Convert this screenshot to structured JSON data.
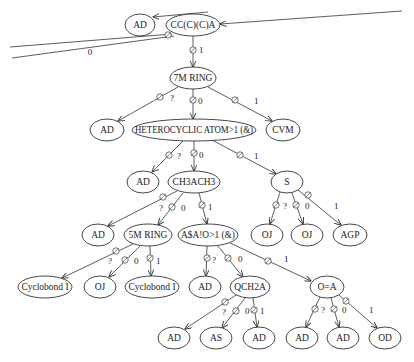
{
  "diagram": {
    "type": "decision-tree",
    "nodes": [
      {
        "id": "n_ad_top",
        "label": "AD",
        "x": 140,
        "y": 25,
        "rx": 15,
        "ry": 11
      },
      {
        "id": "n_root",
        "label": "CC(C)(C)A",
        "x": 193,
        "y": 25,
        "rx": 27,
        "ry": 11
      },
      {
        "id": "n_7mring",
        "label": "7M RING",
        "x": 193,
        "y": 78,
        "rx": 23,
        "ry": 11
      },
      {
        "id": "n_ad_l1",
        "label": "AD",
        "x": 107,
        "y": 130,
        "rx": 17,
        "ry": 11
      },
      {
        "id": "n_hetero",
        "label": "HETEROCYCLIC ATOM>1 (&)",
        "x": 194,
        "y": 130,
        "rx": 62,
        "ry": 11
      },
      {
        "id": "n_cvm",
        "label": "CVM",
        "x": 283,
        "y": 130,
        "rx": 17,
        "ry": 11
      },
      {
        "id": "n_ad_l2",
        "label": "AD",
        "x": 143,
        "y": 182,
        "rx": 16,
        "ry": 11
      },
      {
        "id": "n_ch3ach3",
        "label": "CH3ACH3",
        "x": 194,
        "y": 182,
        "rx": 26,
        "ry": 11
      },
      {
        "id": "n_s",
        "label": "S",
        "x": 287,
        "y": 182,
        "rx": 16,
        "ry": 11
      },
      {
        "id": "n_ad_l3",
        "label": "AD",
        "x": 98,
        "y": 235,
        "rx": 16,
        "ry": 11
      },
      {
        "id": "n_5mring",
        "label": "5M RING",
        "x": 148,
        "y": 235,
        "rx": 24,
        "ry": 11
      },
      {
        "id": "n_asa",
        "label": "A$A!O>1 (&)",
        "x": 208,
        "y": 235,
        "rx": 30,
        "ry": 11
      },
      {
        "id": "n_oj_s1",
        "label": "OJ",
        "x": 267,
        "y": 235,
        "rx": 16,
        "ry": 11
      },
      {
        "id": "n_oj_s2",
        "label": "OJ",
        "x": 307,
        "y": 235,
        "rx": 16,
        "ry": 11
      },
      {
        "id": "n_agp",
        "label": "AGP",
        "x": 350,
        "y": 235,
        "rx": 17,
        "ry": 11
      },
      {
        "id": "n_cyclo1",
        "label": "Cyclobond I",
        "x": 45,
        "y": 287,
        "rx": 27,
        "ry": 11
      },
      {
        "id": "n_oj_5m",
        "label": "OJ",
        "x": 100,
        "y": 287,
        "rx": 16,
        "ry": 11
      },
      {
        "id": "n_cyclo2",
        "label": "Cyclobond I",
        "x": 152,
        "y": 287,
        "rx": 27,
        "ry": 11
      },
      {
        "id": "n_ad_l4",
        "label": "AD",
        "x": 205,
        "y": 287,
        "rx": 16,
        "ry": 11
      },
      {
        "id": "n_qch2a",
        "label": "QCH2A",
        "x": 250,
        "y": 287,
        "rx": 20,
        "ry": 11
      },
      {
        "id": "n_oeqa",
        "label": "O=A",
        "x": 327,
        "y": 287,
        "rx": 17,
        "ry": 11
      },
      {
        "id": "n_ad_b1",
        "label": "AD",
        "x": 174,
        "y": 338,
        "rx": 16,
        "ry": 11
      },
      {
        "id": "n_as_b2",
        "label": "AS",
        "x": 216,
        "y": 338,
        "rx": 16,
        "ry": 11
      },
      {
        "id": "n_ad_b3",
        "label": "AD",
        "x": 259,
        "y": 338,
        "rx": 16,
        "ry": 11
      },
      {
        "id": "n_ad_b4",
        "label": "AD",
        "x": 302,
        "y": 338,
        "rx": 16,
        "ry": 11
      },
      {
        "id": "n_ad_b5",
        "label": "AD",
        "x": 343,
        "y": 338,
        "rx": 16,
        "ry": 11
      },
      {
        "id": "n_od_b6",
        "label": "OD",
        "x": 385,
        "y": 338,
        "rx": 16,
        "ry": 11
      }
    ],
    "edges": [
      {
        "from": "n_root",
        "to": "n_7mring",
        "label": "1",
        "x1": 193,
        "y1": 36,
        "x2": 193,
        "y2": 67,
        "mx": 193,
        "my": 50,
        "lx": 199,
        "ly": 53
      },
      {
        "from": "n_7mring",
        "to": "n_ad_l1",
        "label": "?",
        "x1": 178,
        "y1": 87,
        "x2": 118,
        "y2": 121,
        "mx": 160,
        "my": 97,
        "lx": 170,
        "ly": 101
      },
      {
        "from": "n_7mring",
        "to": "n_hetero",
        "label": "0",
        "x1": 193,
        "y1": 89,
        "x2": 193,
        "y2": 119,
        "mx": 193,
        "my": 100,
        "lx": 198,
        "ly": 104
      },
      {
        "from": "n_7mring",
        "to": "n_cvm",
        "label": "1",
        "x1": 208,
        "y1": 87,
        "x2": 272,
        "y2": 121,
        "mx": 235,
        "my": 100,
        "lx": 254,
        "ly": 104
      },
      {
        "from": "n_hetero",
        "to": "n_ad_l2",
        "label": "?",
        "x1": 183,
        "y1": 141,
        "x2": 152,
        "y2": 172,
        "mx": 169,
        "my": 155,
        "lx": 177,
        "ly": 159
      },
      {
        "from": "n_hetero",
        "to": "n_ch3ach3",
        "label": "0",
        "x1": 194,
        "y1": 141,
        "x2": 194,
        "y2": 171,
        "mx": 194,
        "my": 153,
        "lx": 199,
        "ly": 158
      },
      {
        "from": "n_hetero",
        "to": "n_s",
        "label": "1",
        "x1": 212,
        "y1": 140,
        "x2": 276,
        "y2": 174,
        "mx": 240,
        "my": 155,
        "lx": 254,
        "ly": 159
      },
      {
        "from": "n_ch3ach3",
        "to": "n_ad_l3",
        "label": "?",
        "x1": 177,
        "y1": 191,
        "x2": 108,
        "y2": 226,
        "mx": 163,
        "my": 197,
        "lx": 159,
        "ly": 211
      },
      {
        "from": "n_ch3ach3",
        "to": "n_5mring",
        "label": "0",
        "x1": 183,
        "y1": 193,
        "x2": 158,
        "y2": 225,
        "mx": 172,
        "my": 207,
        "lx": 181,
        "ly": 211
      },
      {
        "from": "n_ch3ach3",
        "to": "n_asa",
        "label": "1",
        "x1": 199,
        "y1": 193,
        "x2": 207,
        "y2": 224,
        "mx": 202,
        "my": 205,
        "lx": 208,
        "ly": 210
      },
      {
        "from": "n_s",
        "to": "n_oj_s1",
        "label": "?",
        "x1": 280,
        "y1": 192,
        "x2": 270,
        "y2": 224,
        "mx": 276,
        "my": 205,
        "lx": 283,
        "ly": 209
      },
      {
        "from": "n_s",
        "to": "n_oj_s2",
        "label": "0",
        "x1": 292,
        "y1": 193,
        "x2": 303,
        "y2": 224,
        "mx": 296,
        "my": 205,
        "lx": 305,
        "ly": 209
      },
      {
        "from": "n_s",
        "to": "n_agp",
        "label": "1",
        "x1": 298,
        "y1": 190,
        "x2": 341,
        "y2": 225,
        "mx": 308,
        "my": 195,
        "lx": 334,
        "ly": 209
      },
      {
        "from": "n_5mring",
        "to": "n_cyclo1",
        "label": "?",
        "x1": 133,
        "y1": 244,
        "x2": 62,
        "y2": 278,
        "mx": 116,
        "my": 251,
        "lx": 108,
        "ly": 264
      },
      {
        "from": "n_5mring",
        "to": "n_oj_5m",
        "label": "0",
        "x1": 140,
        "y1": 246,
        "x2": 109,
        "y2": 277,
        "mx": 125,
        "my": 260,
        "lx": 134,
        "ly": 264
      },
      {
        "from": "n_5mring",
        "to": "n_cyclo2",
        "label": "1",
        "x1": 150,
        "y1": 246,
        "x2": 151,
        "y2": 276,
        "mx": 150,
        "my": 258,
        "lx": 156,
        "ly": 264
      },
      {
        "from": "n_asa",
        "to": "n_ad_l4",
        "label": "?",
        "x1": 207,
        "y1": 246,
        "x2": 206,
        "y2": 276,
        "mx": 207,
        "my": 258,
        "lx": 212,
        "ly": 263
      },
      {
        "from": "n_asa",
        "to": "n_qch2a",
        "label": "0",
        "x1": 218,
        "y1": 246,
        "x2": 243,
        "y2": 277,
        "mx": 228,
        "my": 258,
        "lx": 238,
        "ly": 262
      },
      {
        "from": "n_asa",
        "to": "n_oeqa",
        "label": "1",
        "x1": 230,
        "y1": 243,
        "x2": 311,
        "y2": 281,
        "mx": 268,
        "my": 261,
        "lx": 284,
        "ly": 262
      },
      {
        "from": "n_qch2a",
        "to": "n_ad_b1",
        "label": "?",
        "x1": 236,
        "y1": 295,
        "x2": 185,
        "y2": 329,
        "mx": 225,
        "my": 302,
        "lx": 222,
        "ly": 315
      },
      {
        "from": "n_qch2a",
        "to": "n_as_b2",
        "label": "0",
        "x1": 245,
        "y1": 298,
        "x2": 222,
        "y2": 328,
        "mx": 236,
        "my": 311,
        "lx": 245,
        "ly": 314
      },
      {
        "from": "n_qch2a",
        "to": "n_ad_b3",
        "label": "1",
        "x1": 253,
        "y1": 298,
        "x2": 257,
        "y2": 327,
        "mx": 254,
        "my": 310,
        "lx": 260,
        "ly": 314
      },
      {
        "from": "n_oeqa",
        "to": "n_ad_b4",
        "label": "?",
        "x1": 320,
        "y1": 297,
        "x2": 306,
        "y2": 327,
        "mx": 315,
        "my": 309,
        "lx": 321,
        "ly": 313
      },
      {
        "from": "n_oeqa",
        "to": "n_ad_b5",
        "label": "0",
        "x1": 331,
        "y1": 298,
        "x2": 339,
        "y2": 327,
        "mx": 334,
        "my": 309,
        "lx": 342,
        "ly": 313
      },
      {
        "from": "n_oeqa",
        "to": "n_od_b6",
        "label": "1",
        "x1": 339,
        "y1": 295,
        "x2": 377,
        "y2": 328,
        "mx": 346,
        "my": 301,
        "lx": 369,
        "ly": 313
      }
    ],
    "stray_edges": [
      {
        "name": "incoming-root-edge",
        "x1": 402,
        "y1": 11,
        "x2": 220,
        "y2": 24,
        "arrow": true
      },
      {
        "name": "incoming-ad-top-edge",
        "x1": 208,
        "y1": 12,
        "x2": 153,
        "y2": 17,
        "arrow": true
      },
      {
        "name": "outgoing-left-edge-upper",
        "x1": 172,
        "y1": 34,
        "x2": 10,
        "y2": 47,
        "arrow": false
      },
      {
        "name": "outgoing-left-edge-lower",
        "x1": 174,
        "y1": 36,
        "x2": 12,
        "y2": 58,
        "arrow": false
      }
    ],
    "stray_labels": [
      {
        "name": "left-edge-label",
        "text": "0",
        "x": 90,
        "y": 55
      }
    ],
    "stray_markers": [
      {
        "name": "root-left-branch-marker",
        "x": 168,
        "y": 35
      }
    ],
    "colors": {
      "line": "#333333",
      "text": "#222222",
      "background": "#ffffff"
    }
  }
}
